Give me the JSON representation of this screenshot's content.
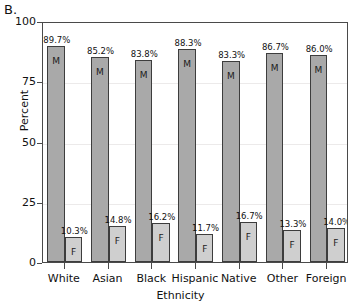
{
  "panel": {
    "letter": "B."
  },
  "chart_data": {
    "type": "bar",
    "title": "",
    "subtitle": "",
    "xlabel": "Ethnicity",
    "ylabel": "Percent",
    "ylim": [
      0,
      100
    ],
    "yticks": [
      0,
      25,
      50,
      75,
      100
    ],
    "ytick_labels": [
      "0",
      "25",
      "50",
      "75",
      "100"
    ],
    "grid": true,
    "grid_axis": "y",
    "legend": "none",
    "categories": [
      "White",
      "Asian",
      "Black",
      "Hispanic",
      "Native",
      "Other",
      "Foreign"
    ],
    "series": [
      {
        "name": "M",
        "letter": "M",
        "color": "#a9a9a9",
        "values": [
          89.7,
          85.2,
          83.8,
          88.3,
          83.3,
          86.7,
          86.0
        ],
        "labels": [
          "89.7%",
          "85.2%",
          "83.8%",
          "88.3%",
          "83.3%",
          "86.7%",
          "86.0%"
        ]
      },
      {
        "name": "F",
        "letter": "F",
        "color": "#cfcfcf",
        "values": [
          10.3,
          14.8,
          16.2,
          11.7,
          16.7,
          13.3,
          14.0
        ],
        "labels": [
          "10.3%",
          "14.8%",
          "16.2%",
          "11.7%",
          "16.7%",
          "13.3%",
          "14.0%"
        ]
      }
    ]
  }
}
